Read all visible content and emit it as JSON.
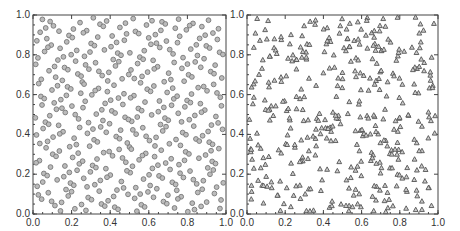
{
  "chart_data": [
    {
      "type": "scatter",
      "title": "",
      "xlabel": "",
      "ylabel": "",
      "xlim": [
        0,
        1
      ],
      "ylim": [
        0,
        1
      ],
      "grid": false,
      "marker": "circle",
      "marker_color": "#777777",
      "x_ticks": [
        "0.0",
        "0.2",
        "0.4",
        "0.6",
        "0.8",
        "1.0"
      ],
      "y_ticks": [
        "0.0",
        "0.2",
        "0.4",
        "0.6",
        "0.8",
        "1.0"
      ],
      "description": "Quasi-random low-discrepancy point set (~400 points) uniformly covering the unit square, arranged in diagonal lattice-like streaks",
      "n_points": 400,
      "generator": "low-discrepancy"
    },
    {
      "type": "scatter",
      "title": "",
      "xlabel": "",
      "ylabel": "",
      "xlim": [
        0,
        1
      ],
      "ylim": [
        0,
        1
      ],
      "grid": false,
      "marker": "triangle",
      "marker_color": "#555555",
      "x_ticks": [
        "0.0",
        "0.2",
        "0.4",
        "0.6",
        "0.8",
        "1.0"
      ],
      "y_ticks": [
        "0.0",
        "0.2",
        "0.4",
        "0.6",
        "0.8",
        "1.0"
      ],
      "description": "Pseudo-random point set (~400 points) in the unit square with visible clusters and gaps",
      "n_points": 400,
      "generator": "pseudo-random"
    }
  ]
}
